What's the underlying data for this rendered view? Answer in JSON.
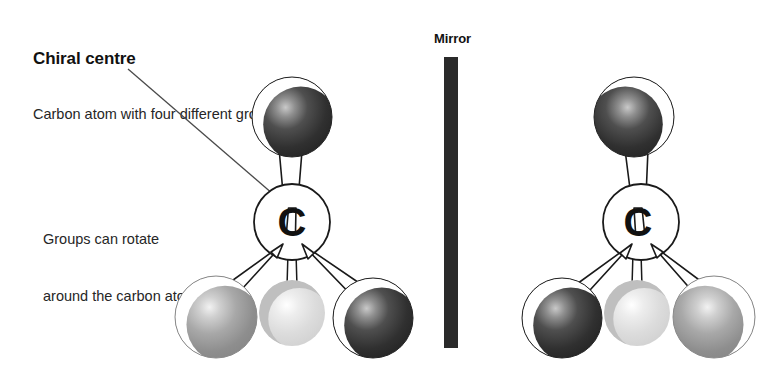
{
  "canvas": {
    "width": 770,
    "height": 372,
    "background": "#ffffff"
  },
  "labels": {
    "title": "Chiral centre",
    "subtitle": "Carbon atom with four different groups",
    "rotate_note_line1": "Groups can rotate",
    "rotate_note_line2": "around the carbon atom",
    "mirror": "Mirror"
  },
  "carbon_symbol": "C",
  "colors": {
    "background": "#ffffff",
    "outline": "#1a1a1a",
    "text": "#262626",
    "title": "#111111",
    "mirror_bar": "#2a2a2a",
    "atom_dark": "#2e2e2e",
    "atom_gray": "#9a9a9a",
    "atom_light": "#d8d8d8",
    "highlight": "#ffffff"
  },
  "diagram": {
    "type": "chirality-enantiomer-pair",
    "mirror_plane_x": 451,
    "molecules": [
      {
        "name": "left-enantiomer",
        "handedness": "left",
        "carbon_center": {
          "x": 292,
          "y": 222,
          "r": 38
        },
        "atoms": [
          {
            "position": "top",
            "x": 292,
            "y": 117,
            "r": 40,
            "shade": "dark",
            "highlight_side": "left",
            "bond": "wedge"
          },
          {
            "position": "bottom-left",
            "x": 216,
            "y": 317,
            "r": 41,
            "shade": "gray",
            "highlight_side": "left",
            "bond": "wedge"
          },
          {
            "position": "bottom-centre",
            "x": 292,
            "y": 313,
            "r": 33,
            "shade": "light",
            "highlight_side": "left",
            "bond": "line"
          },
          {
            "position": "bottom-right",
            "x": 373,
            "y": 318,
            "r": 40,
            "shade": "dark",
            "highlight_side": "left",
            "bond": "wedge"
          }
        ]
      },
      {
        "name": "right-enantiomer",
        "handedness": "right",
        "carbon_center": {
          "x": 641,
          "y": 222,
          "r": 38
        },
        "atoms": [
          {
            "position": "top",
            "x": 634,
            "y": 117,
            "r": 40,
            "shade": "dark",
            "highlight_side": "right",
            "bond": "wedge"
          },
          {
            "position": "bottom-left",
            "x": 562,
            "y": 318,
            "r": 40,
            "shade": "dark",
            "highlight_side": "left",
            "bond": "wedge"
          },
          {
            "position": "bottom-centre",
            "x": 637,
            "y": 313,
            "r": 33,
            "shade": "light",
            "highlight_side": "left",
            "bond": "line"
          },
          {
            "position": "bottom-right",
            "x": 714,
            "y": 317,
            "r": 41,
            "shade": "gray",
            "highlight_side": "right",
            "bond": "wedge"
          }
        ]
      }
    ],
    "leader_line": {
      "x1": 128,
      "y1": 69,
      "x2": 288,
      "y2": 207
    }
  }
}
